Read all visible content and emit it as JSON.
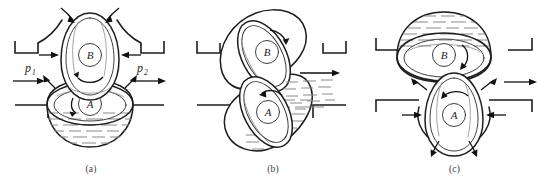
{
  "figure": {
    "background_color": "#ffffff",
    "line_color": "#1d1d1d",
    "hatch_color": "#8a8a8a"
  },
  "panels": [
    {
      "id": "a",
      "caption": "(a)",
      "labels": {
        "upper_body": "B",
        "lower_body": "A",
        "pressure_in": "p",
        "pressure_in_sub": "1",
        "pressure_out": "p",
        "pressure_out_sub": "2"
      },
      "icons": {
        "inflow_arrow": "arrow-right-icon",
        "outflow_arrow": "arrow-right-icon",
        "squeeze_arrows": "arrow-inward-icon",
        "splash_arrows": "arrow-outward-icon",
        "circulation_arrow": "curved-arrow-icon"
      },
      "liquid": "lower bowl filled with dashed liquid hatching"
    },
    {
      "id": "b",
      "caption": "(b)",
      "labels": {
        "upper_body": "B",
        "lower_body": "A"
      },
      "icons": {
        "ejection_arrow": "arrow-right-icon",
        "circulation_arrow": "curved-arrow-icon"
      },
      "liquid": "lower-right region filled with dashed liquid hatching and spray"
    },
    {
      "id": "c",
      "caption": "(c)",
      "labels": {
        "upper_body": "B",
        "lower_body": "A"
      },
      "icons": {
        "outflow_arrow": "arrow-right-icon",
        "squeeze_arrows": "arrow-inward-icon",
        "splash_arrows": "arrow-outward-icon",
        "circulation_arrow": "curved-arrow-icon"
      },
      "liquid": "upper dome filled with dashed liquid hatching"
    }
  ]
}
